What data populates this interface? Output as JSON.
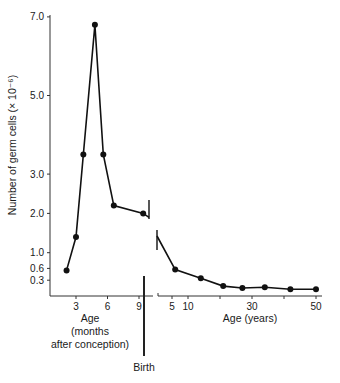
{
  "chart_data": {
    "type": "line",
    "title": "",
    "ylabel": "Number of germ cells (× 10⁻⁶)",
    "ylim": [
      0,
      7.0
    ],
    "yticks": [
      0.3,
      0.6,
      1.0,
      2.0,
      3.0,
      5.0,
      7.0
    ],
    "ytick_labels": [
      "0.3",
      "0.6",
      "1.0",
      "2.0",
      "3.0",
      "5.0",
      "7.0"
    ],
    "grid": false,
    "legend": null,
    "panels": [
      {
        "name": "prenatal",
        "xlabel": "Age (months after conception)",
        "xlabel_lines": [
          "Age",
          "(months",
          "after conception)"
        ],
        "xticks": [
          3,
          6,
          9
        ],
        "xtick_labels": [
          "3",
          "6",
          "9"
        ],
        "x": [
          2.1,
          3.0,
          3.7,
          4.8,
          5.6,
          6.6,
          9.4
        ],
        "y": [
          0.55,
          1.4,
          3.5,
          6.8,
          3.5,
          2.2,
          2.0
        ]
      },
      {
        "name": "postnatal",
        "xlabel": "Age (years)",
        "xticks": [
          5,
          10,
          20,
          30,
          40,
          50
        ],
        "xtick_labels": [
          "5",
          "10",
          "",
          "30",
          "",
          "50"
        ],
        "x": [
          6,
          14,
          21,
          27,
          34,
          42,
          50
        ],
        "y": [
          0.57,
          0.35,
          0.15,
          0.1,
          0.12,
          0.07,
          0.07
        ]
      }
    ],
    "annotations": [
      {
        "text": "Birth",
        "position": "vertical line between prenatal and postnatal axes"
      }
    ],
    "axis_break": true
  },
  "labels": {
    "ylabel": "Number of germ cells (× 10⁻⁶)",
    "prenatal_x_line1": "Age",
    "prenatal_x_line2": "(months",
    "prenatal_x_line3": "after conception)",
    "postnatal_x": "Age (years)",
    "birth": "Birth"
  },
  "colors": {
    "line": "#111111",
    "axis": "#333333",
    "text": "#1a1a1a"
  }
}
